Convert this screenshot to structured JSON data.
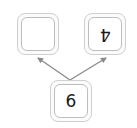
{
  "diagram": {
    "type": "number-bond",
    "whole": {
      "value": "6",
      "position": "bottom"
    },
    "parts": [
      {
        "value": "",
        "position": "top-left",
        "rotated": false
      },
      {
        "value": "4",
        "position": "top-right",
        "rotated": true
      }
    ],
    "arrows": [
      {
        "from": "whole",
        "to": "top-left"
      },
      {
        "from": "whole",
        "to": "top-right"
      }
    ],
    "colors": {
      "arrow": "#8a8a8a",
      "box_border": "#c4c4c4",
      "text": "#1a1a1a"
    }
  }
}
